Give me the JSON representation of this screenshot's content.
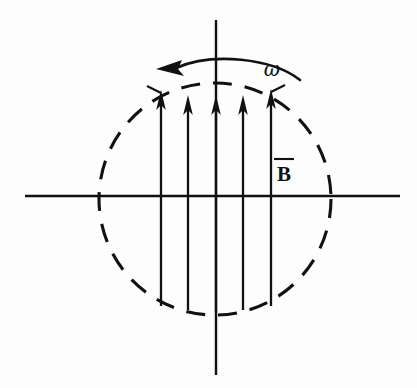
{
  "figure": {
    "background_color": "#fdfdfd",
    "ink_color": "#111111",
    "width": 417,
    "height": 388
  },
  "labels": {
    "omega": "ω",
    "field_vector": "B"
  },
  "axes": {
    "vertical": {
      "name": "vertical-axis",
      "x": 216,
      "y_top": 20,
      "y_bottom": 375
    },
    "horizontal": {
      "name": "horizontal-axis",
      "y": 196,
      "x_left": 25,
      "x_right": 400
    }
  },
  "region": {
    "name": "dashed-circle",
    "center_x": 215,
    "center_y": 199,
    "radius": 116,
    "dash_pattern": "19 13"
  },
  "field_arrows": {
    "count": 5,
    "direction": "up",
    "x_positions": [
      161,
      188,
      216,
      243,
      271
    ],
    "tip_y": [
      93,
      96,
      96,
      96,
      90
    ],
    "tail_y": [
      306,
      310,
      312,
      310,
      306
    ],
    "head_width": 11,
    "head_length": 19
  },
  "rotation_arrow": {
    "name": "omega-arc",
    "direction": "counterclockwise",
    "arc_start_x": 300,
    "arc_start_y": 79,
    "arc_end_x": 176,
    "arc_end_y": 68,
    "arc_peak_y": 58,
    "head_tip_x": 156,
    "head_tip_y": 69
  },
  "omega_label_position": {
    "x": 272,
    "y": 75
  },
  "b_label_position": {
    "x": 283,
    "y": 180,
    "overbar_x1": 274,
    "overbar_x2": 293,
    "overbar_y": 160
  }
}
